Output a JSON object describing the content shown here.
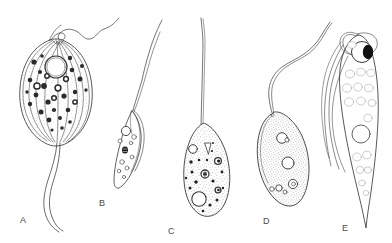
{
  "figure": {
    "kind": "scientific-line-drawing-plate",
    "background_color": "#ffffff",
    "ink_color": "#3a3a3a",
    "label_color": "#4a4a4a",
    "panel_count": 5
  },
  "labels": [
    {
      "text": "A",
      "x": 20,
      "y": 215
    },
    {
      "text": "B",
      "x": 99,
      "y": 198
    },
    {
      "text": "C",
      "x": 168,
      "y": 226
    },
    {
      "text": "D",
      "x": 263,
      "y": 216
    },
    {
      "text": "E",
      "x": 342,
      "y": 223
    }
  ],
  "specimens": [
    {
      "id": "A",
      "name": "specimen-a",
      "body_shape": "pear-shaped with longitudinal striations",
      "features": [
        "apical flagellum with loop",
        "two long trailing flagella",
        "large clear nucleus",
        "numerous dark granules",
        "curved longitudinal lines"
      ]
    },
    {
      "id": "B",
      "name": "specimen-b",
      "body_shape": "elongated lance shape, tilted",
      "features": [
        "long anterior flagellum",
        "undulating membrane",
        "clear nucleus",
        "dark kinetoplast",
        "small vacuoles"
      ]
    },
    {
      "id": "C",
      "name": "specimen-c",
      "body_shape": "teardrop / pear-shaped",
      "features": [
        "long straight flagellum",
        "stippled cytoplasm",
        "cytostome funnel",
        "open vacuoles",
        "dark granules",
        "large posterior vacuole"
      ]
    },
    {
      "id": "D",
      "name": "specimen-d",
      "body_shape": "ovoid, tilted",
      "features": [
        "two long wavy flagella",
        "dense stippled cytoplasm",
        "several open circular vacuoles"
      ]
    },
    {
      "id": "E",
      "name": "specimen-e",
      "body_shape": "narrow spindle tapering to a point",
      "features": [
        "large nucleus with solid karyosome",
        "multiple trailing flagella",
        "faint internal vesicles",
        "pointed posterior"
      ]
    }
  ]
}
